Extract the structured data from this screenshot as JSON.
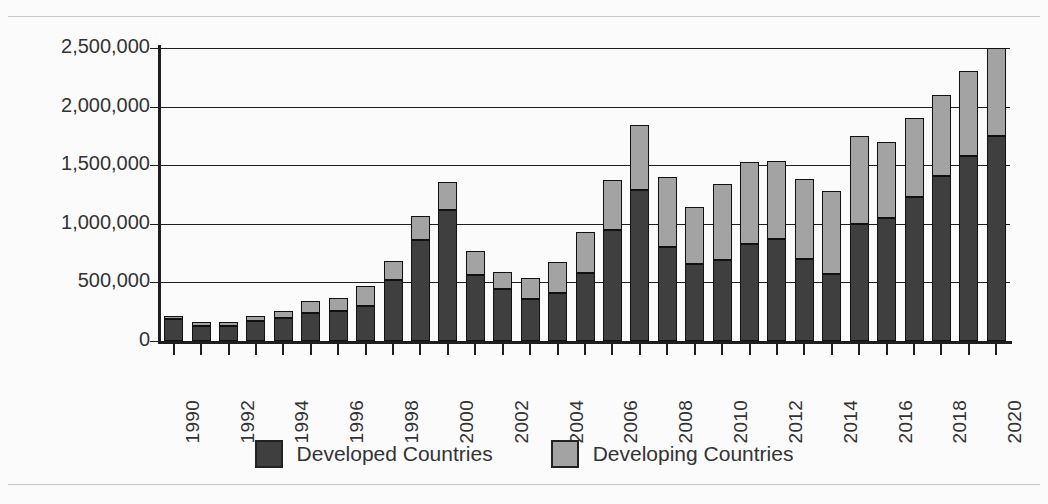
{
  "chart_data": {
    "type": "bar",
    "subtype": "stacked-bar",
    "title": "",
    "xlabel": "",
    "ylabel": "",
    "ylim": [
      0,
      2500000
    ],
    "ytick_values": [
      0,
      500000,
      1000000,
      1500000,
      2000000,
      2500000
    ],
    "ytick_labels": [
      "0",
      "500,000",
      "1,000,000",
      "1,500,000",
      "2,000,000",
      "2,500,000"
    ],
    "grid": true,
    "legend_position": "bottom",
    "x": [
      1990,
      1991,
      1992,
      1993,
      1994,
      1995,
      1996,
      1997,
      1998,
      1999,
      2000,
      2001,
      2002,
      2003,
      2004,
      2005,
      2006,
      2007,
      2008,
      2009,
      2010,
      2011,
      2012,
      2013,
      2014,
      2015,
      2016,
      2017,
      2018,
      2019,
      2020
    ],
    "categories": [
      "1990",
      "1991",
      "1992",
      "1993",
      "1994",
      "1995",
      "1996",
      "1997",
      "1998",
      "1999",
      "2000",
      "2001",
      "2002",
      "2003",
      "2004",
      "2005",
      "2006",
      "2007",
      "2008",
      "2009",
      "2010",
      "2011",
      "2012",
      "2013",
      "2014",
      "2015",
      "2016",
      "2017",
      "2018",
      "2019",
      "2020"
    ],
    "xtick_labels_shown": [
      "1990",
      "1992",
      "1994",
      "1996",
      "1998",
      "2000",
      "2002",
      "2004",
      "2006",
      "2008",
      "2010",
      "2012",
      "2014",
      "2016",
      "2018",
      "2020"
    ],
    "xtick_label_rotation": -90,
    "series": [
      {
        "name": "Developed Countries",
        "color": "#3f3f3f",
        "values": [
          185000,
          130000,
          130000,
          170000,
          200000,
          240000,
          260000,
          300000,
          520000,
          860000,
          1120000,
          560000,
          440000,
          360000,
          410000,
          580000,
          950000,
          1290000,
          800000,
          660000,
          690000,
          830000,
          870000,
          700000,
          570000,
          1000000,
          1050000,
          1230000,
          1410000,
          1580000,
          1750000
        ]
      },
      {
        "name": "Developing Countries",
        "color": "#a3a3a3",
        "values": [
          25000,
          30000,
          30000,
          45000,
          60000,
          100000,
          110000,
          170000,
          160000,
          210000,
          240000,
          210000,
          150000,
          180000,
          260000,
          350000,
          420000,
          550000,
          600000,
          480000,
          650000,
          700000,
          670000,
          680000,
          710000,
          750000,
          650000,
          670000,
          690000,
          720000,
          750000
        ]
      }
    ],
    "totals": [
      210000,
      160000,
      160000,
      215000,
      260000,
      340000,
      370000,
      470000,
      680000,
      1070000,
      1360000,
      770000,
      590000,
      540000,
      670000,
      930000,
      1370000,
      1840000,
      1400000,
      1140000,
      1340000,
      1530000,
      1540000,
      1380000,
      1280000,
      1750000,
      1700000,
      1900000,
      2100000,
      2300000,
      2500000
    ]
  },
  "legend": {
    "items": [
      {
        "label": "Developed Countries",
        "swatch": "dark-gray-swatch"
      },
      {
        "label": "Developing Countries",
        "swatch": "light-gray-swatch"
      }
    ]
  }
}
